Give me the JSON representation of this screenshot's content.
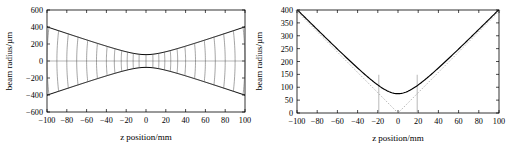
{
  "figure": {
    "panels": [
      "left",
      "right"
    ],
    "background": "#ffffff",
    "line_color": "#000000",
    "aux_color": "#8a8a8a"
  },
  "chart_data": [
    {
      "type": "line",
      "panel": "left",
      "title": "",
      "xlabel": "z position/mm",
      "ylabel": "beam radius/µm",
      "xlim": [
        -100,
        100
      ],
      "ylim": [
        -600,
        600
      ],
      "xticks": [
        -100,
        -80,
        -60,
        -40,
        -20,
        0,
        20,
        40,
        60,
        80,
        100
      ],
      "xticklabels": [
        "−100",
        "−80",
        "−60",
        "−40",
        "−20",
        "0",
        "20",
        "40",
        "60",
        "80",
        "100"
      ],
      "yticks": [
        -600,
        -400,
        -200,
        0,
        200,
        400,
        600
      ],
      "yticklabels": [
        "−600",
        "−400",
        "−200",
        "0",
        "200",
        "400",
        "600"
      ],
      "grid": false,
      "legend": "none",
      "waist_radius_um": 75,
      "rayleigh_range_mm": 19,
      "series": [
        {
          "name": "upper beam envelope w(z)",
          "style": "solid",
          "x": [
            -100,
            -90,
            -80,
            -70,
            -60,
            -50,
            -40,
            -30,
            -20,
            -10,
            0,
            10,
            20,
            30,
            40,
            50,
            60,
            70,
            80,
            90,
            100
          ],
          "values": [
            397,
            358,
            319,
            280,
            241,
            203,
            165,
            129,
            103,
            85,
            75,
            85,
            103,
            129,
            165,
            203,
            241,
            280,
            319,
            358,
            397
          ]
        },
        {
          "name": "lower beam envelope -w(z)",
          "style": "solid",
          "x": [
            -100,
            -90,
            -80,
            -70,
            -60,
            -50,
            -40,
            -30,
            -20,
            -10,
            0,
            10,
            20,
            30,
            40,
            50,
            60,
            70,
            80,
            90,
            100
          ],
          "values": [
            -397,
            -358,
            -319,
            -280,
            -241,
            -203,
            -165,
            -129,
            -103,
            -85,
            -75,
            -85,
            -103,
            -129,
            -165,
            -203,
            -241,
            -280,
            -319,
            -358,
            -397
          ]
        },
        {
          "name": "optical axis",
          "style": "solid-thin",
          "x": [
            -100,
            100
          ],
          "values": [
            0,
            0
          ]
        },
        {
          "name": "wavefront curves",
          "style": "solid-thin",
          "count": 21,
          "z_positions": [
            -100,
            -90,
            -80,
            -70,
            -60,
            -50,
            -40,
            -32,
            -25,
            -19,
            -13,
            -7,
            0,
            7,
            13,
            19,
            25,
            32,
            40,
            50,
            60,
            70,
            80,
            90,
            100
          ]
        }
      ]
    },
    {
      "type": "line",
      "panel": "right",
      "title": "",
      "xlabel": "z position/mm",
      "ylabel": "beam radius/µm",
      "xlim": [
        -100,
        100
      ],
      "ylim": [
        0,
        400
      ],
      "xticks": [
        -100,
        -80,
        -60,
        -40,
        -20,
        0,
        20,
        40,
        60,
        80,
        100
      ],
      "xticklabels": [
        "−100",
        "−80",
        "−60",
        "−40",
        "−20",
        "0",
        "20",
        "40",
        "60",
        "80",
        "100"
      ],
      "yticks": [
        0,
        50,
        100,
        150,
        200,
        250,
        300,
        350,
        400
      ],
      "yticklabels": [
        "0",
        "50",
        "100",
        "150",
        "200",
        "250",
        "300",
        "350",
        "400"
      ],
      "grid": false,
      "legend": "none",
      "waist_radius_um": 75,
      "rayleigh_range_mm": 19,
      "series": [
        {
          "name": "beam radius w(z)",
          "style": "solid",
          "x": [
            -100,
            -90,
            -80,
            -70,
            -60,
            -50,
            -40,
            -30,
            -20,
            -10,
            0,
            10,
            20,
            30,
            40,
            50,
            60,
            70,
            80,
            90,
            100
          ],
          "values": [
            397,
            358,
            319,
            280,
            241,
            203,
            165,
            129,
            103,
            85,
            75,
            85,
            103,
            129,
            165,
            203,
            241,
            280,
            319,
            358,
            397
          ]
        },
        {
          "name": "far-field asymptote",
          "style": "dashed",
          "x": [
            -100,
            0,
            100
          ],
          "values": [
            395,
            0,
            395
          ]
        },
        {
          "name": "Rayleigh range marker (left)",
          "style": "vertical-line",
          "x": -19,
          "values": [
            0,
            106
          ]
        },
        {
          "name": "Rayleigh range marker (right)",
          "style": "vertical-line",
          "x": 19,
          "values": [
            0,
            106
          ]
        }
      ]
    }
  ]
}
